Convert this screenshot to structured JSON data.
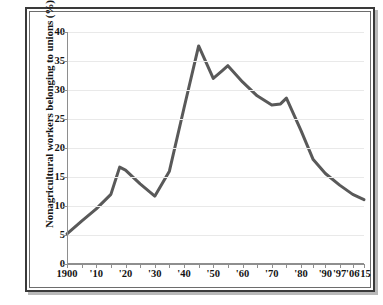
{
  "chart_data": {
    "type": "line",
    "title": "",
    "xlabel": "",
    "ylabel": "Nonagricultural workers belonging to unions (%)",
    "ylim": [
      0,
      40
    ],
    "ytick_labels": [
      "0",
      "5",
      "10",
      "15",
      "20",
      "25",
      "30",
      "35",
      "40"
    ],
    "ytick_values": [
      0,
      5,
      10,
      15,
      20,
      25,
      30,
      35,
      40
    ],
    "xtick_labels": [
      "1900",
      "'10",
      "'20",
      "'30",
      "'40",
      "'50",
      "'60",
      "'70",
      "'80",
      "'90",
      "'97",
      "'06",
      "'15"
    ],
    "xtick_values": [
      1900,
      1910,
      1920,
      1930,
      1940,
      1950,
      1960,
      1970,
      1980,
      1990,
      1997,
      2006,
      2015
    ],
    "grid": true,
    "legend": "none",
    "line_color": "#595959",
    "grid_color": "#e9e9e9",
    "axis_color": "#8e8e8e",
    "background": "#ffffff",
    "x": [
      1900,
      1905,
      1910,
      1915,
      1918,
      1920,
      1925,
      1930,
      1935,
      1940,
      1945,
      1950,
      1953,
      1955,
      1960,
      1965,
      1970,
      1973,
      1975,
      1980,
      1985,
      1990,
      1997,
      2006,
      2015
    ],
    "values": [
      5.2,
      7.4,
      9.5,
      12.0,
      16.7,
      16.2,
      13.8,
      11.7,
      16.0,
      26.9,
      37.6,
      32.0,
      33.3,
      34.2,
      31.4,
      29.0,
      27.4,
      27.6,
      28.6,
      23.0,
      18.0,
      15.6,
      13.6,
      12.0,
      11.1
    ],
    "series": [
      {
        "name": "Nonagricultural workers belonging to unions (%)",
        "values": [
          5.2,
          7.4,
          9.5,
          12.0,
          16.7,
          16.2,
          13.8,
          11.7,
          16.0,
          26.9,
          37.6,
          32.0,
          33.3,
          34.2,
          31.4,
          29.0,
          27.4,
          27.6,
          28.6,
          23.0,
          18.0,
          15.6,
          13.6,
          12.0,
          11.1
        ]
      }
    ]
  }
}
